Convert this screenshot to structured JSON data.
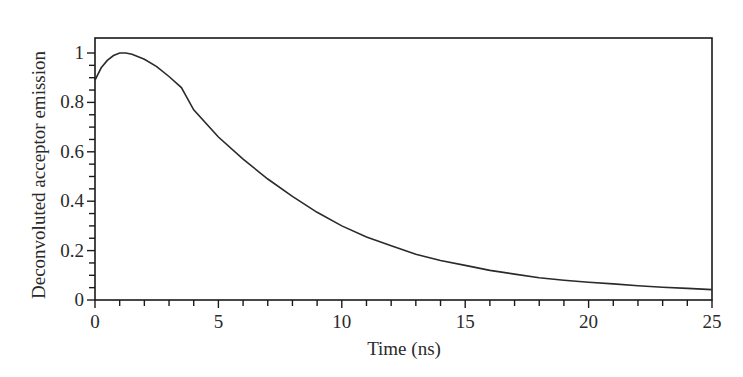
{
  "chart_data": {
    "type": "line",
    "title": "",
    "xlabel": "Time (ns)",
    "ylabel": "Deconvoluted acceptor emission",
    "xlim": [
      0,
      25
    ],
    "ylim": [
      0,
      1.05
    ],
    "grid": false,
    "legend": null,
    "x_ticks": [
      0,
      5,
      10,
      15,
      20,
      25
    ],
    "x_tick_labels": [
      "0",
      "5",
      "10",
      "15",
      "20",
      "25"
    ],
    "x_minor_step": 1,
    "y_ticks": [
      0,
      0.2,
      0.4,
      0.6,
      0.8,
      1
    ],
    "y_tick_labels": [
      "0",
      "0.2",
      "0.4",
      "0.6",
      "0.8",
      "1"
    ],
    "y_minor_step": 0.05,
    "series": [
      {
        "name": "Deconvoluted acceptor emission",
        "color": "#2a2a2a",
        "x": [
          0,
          0.25,
          0.5,
          0.75,
          1,
          1.25,
          1.5,
          2,
          2.5,
          3,
          3.5,
          4,
          5,
          6,
          7,
          8,
          9,
          10,
          11,
          12,
          13,
          14,
          15,
          16,
          17,
          18,
          19,
          20,
          21,
          22,
          23,
          24,
          25
        ],
        "y": [
          0.89,
          0.94,
          0.97,
          0.99,
          1.0,
          1.0,
          0.995,
          0.975,
          0.945,
          0.905,
          0.86,
          0.77,
          0.66,
          0.57,
          0.49,
          0.42,
          0.355,
          0.3,
          0.255,
          0.22,
          0.185,
          0.16,
          0.14,
          0.12,
          0.105,
          0.09,
          0.08,
          0.072,
          0.065,
          0.058,
          0.052,
          0.047,
          0.042
        ]
      }
    ]
  }
}
